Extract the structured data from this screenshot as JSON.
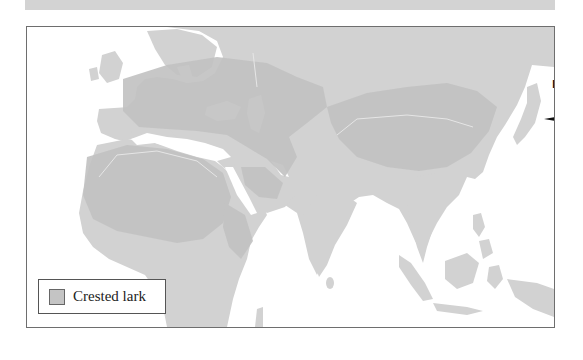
{
  "map": {
    "region": "Europe, Africa and Asia",
    "colors": {
      "ocean": "#ffffff",
      "land": "#d0d0d0",
      "range": "#c3c3c3",
      "frame_border": "#6e6e6e",
      "top_band": "#d3d3d3"
    },
    "compass": {
      "label": "N"
    },
    "legend": {
      "items": [
        {
          "label": "Crested lark",
          "swatch_color": "#c4c4c4"
        }
      ]
    }
  }
}
